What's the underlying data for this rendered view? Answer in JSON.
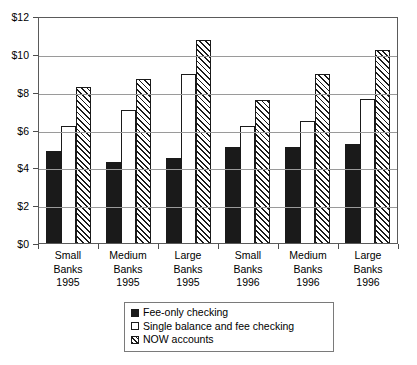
{
  "chart_data": {
    "type": "bar",
    "title": "",
    "subtitle": "",
    "xlabel": "",
    "ylabel": "",
    "ylim": [
      0,
      12
    ],
    "ytick_values": [
      0,
      2,
      4,
      6,
      8,
      10,
      12
    ],
    "ytick_labels": [
      "$0",
      "$2",
      "$4",
      "$6",
      "$8",
      "$10",
      "$12"
    ],
    "grid": true,
    "legend_position": "bottom-center",
    "categories": [
      "Small Banks 1995",
      "Medium Banks 1995",
      "Large Banks 1995",
      "Small Banks 1996",
      "Medium Banks 1996",
      "Large Banks 1996"
    ],
    "category_lines": [
      [
        "Small",
        "Banks",
        "1995"
      ],
      [
        "Medium",
        "Banks",
        "1995"
      ],
      [
        "Large",
        "Banks",
        "1995"
      ],
      [
        "Small",
        "Banks",
        "1996"
      ],
      [
        "Medium",
        "Banks",
        "1996"
      ],
      [
        "Large",
        "Banks",
        "1996"
      ]
    ],
    "series": [
      {
        "name": "Fee-only checking",
        "fill": "solid-black",
        "color": "#1a1a1a",
        "values": [
          4.85,
          4.3,
          4.5,
          5.1,
          5.05,
          5.25
        ]
      },
      {
        "name": "Single balance and fee checking",
        "fill": "white",
        "color": "#ffffff",
        "values": [
          6.2,
          7.05,
          8.95,
          6.2,
          6.45,
          7.6
        ]
      },
      {
        "name": "NOW accounts",
        "fill": "diagonal-hatch",
        "color": "#1a1a1a",
        "values": [
          8.25,
          8.65,
          10.75,
          7.55,
          8.95,
          10.2
        ]
      }
    ]
  },
  "legend": {
    "items": [
      {
        "label": "Fee-only checking"
      },
      {
        "label": "Single balance and fee checking"
      },
      {
        "label": "NOW accounts"
      }
    ]
  }
}
